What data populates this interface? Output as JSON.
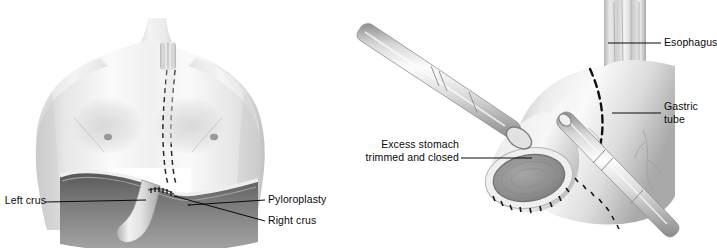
{
  "figure": {
    "type": "medical-illustration",
    "background_color": "#ffffff",
    "ink_color": "#0a0a0a",
    "palette": {
      "skin_light": "#f2f2f2",
      "skin_mid": "#d9d9d9",
      "skin_shadow": "#9e9e9e",
      "organ_light": "#ededed",
      "organ_mid": "#c9c9c9",
      "organ_dark": "#8a8a8a",
      "cavity_dark": "#6e6e6e",
      "instrument_light": "#fbfbfb",
      "instrument_mid": "#bdbdbd",
      "staple_line": "#1a1a1a",
      "closed_end_fill": "#909090"
    }
  },
  "panels": [
    {
      "id": "panel-left",
      "name": "torso-substernal-gastric-pull-up",
      "subject": "anterior torso with substernal route and diaphragm",
      "labels": [
        {
          "id": "left-crus",
          "text": "Left crus",
          "side": "left",
          "lines": [
            "Left crus"
          ]
        },
        {
          "id": "pyloroplasty",
          "text": "Pyloroplasty",
          "side": "right",
          "lines": [
            "Pyloroplasty"
          ]
        },
        {
          "id": "right-crus",
          "text": "Right crus",
          "side": "right",
          "lines": [
            "Right crus"
          ]
        }
      ]
    },
    {
      "id": "panel-right",
      "name": "gastric-tube-formation-stapling",
      "subject": "stomach fashioned into gastric tube with staplers",
      "labels": [
        {
          "id": "esophagus",
          "text": "Esophagus",
          "side": "right",
          "lines": [
            "Esophagus"
          ]
        },
        {
          "id": "gastric-tube",
          "text": "Gastric tube",
          "side": "right",
          "lines": [
            "Gastric",
            "tube"
          ]
        },
        {
          "id": "excess-stomach",
          "text": "Excess stomach trimmed and closed",
          "side": "left",
          "lines": [
            "Excess stomach",
            "trimmed and closed"
          ]
        }
      ]
    }
  ]
}
